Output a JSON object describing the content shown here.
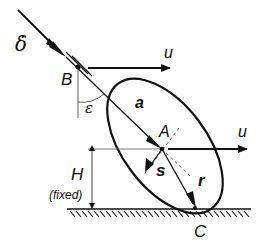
{
  "diagram": {
    "type": "mechanics-schematic",
    "labels": {
      "delta_dot": "δ̇",
      "B": "B",
      "epsilon": "ε",
      "u_top": "u",
      "a": "a",
      "A": "A",
      "u_mid": "u",
      "s": "s",
      "r": "r",
      "H": "H",
      "fixed": "(fixed)",
      "C": "C"
    },
    "colors": {
      "stroke": "#111111",
      "thin_line": "#555555",
      "background": "#ffffff"
    }
  }
}
